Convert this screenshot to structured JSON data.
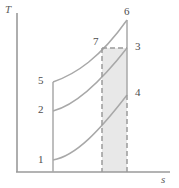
{
  "figure": {
    "type": "thermodynamic-ts-diagram",
    "axes": {
      "y_label": "T",
      "x_label": "s",
      "origin_px": [
        17,
        172
      ],
      "y_axis_top_px": [
        17,
        13
      ],
      "x_axis_right_px": [
        170,
        172
      ]
    },
    "colors": {
      "axis": "#9a9a9a",
      "curve": "#a8a8a8",
      "dashed": "#9a9a9a",
      "shade_fill": "#e8e8e8",
      "label_text": "#4d4d4d",
      "background": "#ffffff"
    },
    "state_points": [
      {
        "id": "1",
        "label": "1",
        "label_px": [
          38,
          154
        ],
        "point_px": [
          53,
          160
        ]
      },
      {
        "id": "2",
        "label": "2",
        "label_px": [
          38,
          104
        ],
        "point_px": [
          53,
          111
        ]
      },
      {
        "id": "3",
        "label": "3",
        "label_px": [
          135,
          42
        ],
        "point_px": [
          127,
          48
        ]
      },
      {
        "id": "4",
        "label": "4",
        "label_px": [
          135,
          88
        ],
        "point_px": [
          127,
          95
        ]
      },
      {
        "id": "5",
        "label": "5",
        "label_px": [
          38,
          76
        ],
        "point_px": [
          53,
          82
        ]
      },
      {
        "id": "6",
        "label": "6",
        "label_px": [
          124,
          9
        ],
        "point_px": [
          127,
          20
        ]
      },
      {
        "id": "7",
        "label": "7",
        "label_px": [
          94,
          38
        ],
        "point_px": [
          102,
          48
        ]
      }
    ],
    "curves": [
      {
        "name": "curve-1-4",
        "from": "1",
        "to": "4",
        "style": "solid",
        "path": "M 53 160 C 76 156 100 130 127 95"
      },
      {
        "name": "curve-2-3",
        "from": "2",
        "to": "3",
        "style": "solid",
        "path": "M 53 111 C 76 105 102 80 127 48"
      },
      {
        "name": "curve-5-6",
        "from": "5",
        "to": "6",
        "style": "solid",
        "path": "M 53 82 C 76 74 100 58 127 20"
      }
    ],
    "segments": [
      {
        "name": "left-vertical-5-1",
        "style": "solid",
        "path": "M 53 82 L 53 172"
      },
      {
        "name": "right-vertical-6-4",
        "style": "solid",
        "path": "M 127 20 L 127 95"
      },
      {
        "name": "dashed-vertical-4-axis",
        "style": "dashed",
        "path": "M 127 95 L 127 172"
      },
      {
        "name": "dashed-horizontal-7-3",
        "style": "dashed",
        "path": "M 102 48 L 127 48"
      },
      {
        "name": "dashed-vertical-7-axis",
        "style": "dashed",
        "path": "M 102 48 L 102 172"
      }
    ],
    "shaded_region": {
      "name": "shaded-area-7-3-axis",
      "path": "M 102 48 L 127 48 L 127 172 L 102 172 Z",
      "fill": "#e8e8e8"
    }
  }
}
